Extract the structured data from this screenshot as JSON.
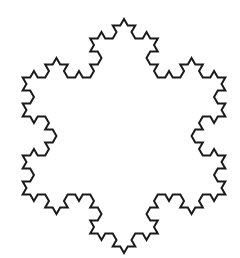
{
  "figure": {
    "type": "koch-snowflake",
    "iterations": 3,
    "center": [
      124,
      136
    ],
    "radius": 117,
    "start_angle_deg": -90,
    "stroke_color": "#1a1a1a",
    "stroke_width": 2,
    "fill": "#ffffff",
    "background": "#ffffff"
  }
}
